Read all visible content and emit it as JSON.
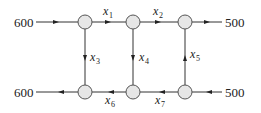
{
  "diagram": {
    "type": "network-flow",
    "inputs": {
      "top_left": "600",
      "top_right": "500",
      "bottom_left": "600",
      "bottom_right": "500"
    },
    "variables": [
      {
        "name": "x",
        "sub": "1",
        "from": "node-top-left",
        "to": "node-top-middle",
        "direction": "right"
      },
      {
        "name": "x",
        "sub": "2",
        "from": "node-top-middle",
        "to": "node-top-right",
        "direction": "right"
      },
      {
        "name": "x",
        "sub": "3",
        "from": "node-top-left",
        "to": "node-bottom-left",
        "direction": "down"
      },
      {
        "name": "x",
        "sub": "4",
        "from": "node-top-middle",
        "to": "node-bottom-middle",
        "direction": "down"
      },
      {
        "name": "x",
        "sub": "5",
        "from": "node-bottom-right",
        "to": "node-top-right",
        "direction": "up"
      },
      {
        "name": "x",
        "sub": "6",
        "from": "node-bottom-middle",
        "to": "node-bottom-left",
        "direction": "left"
      },
      {
        "name": "x",
        "sub": "7",
        "from": "node-bottom-right",
        "to": "node-bottom-middle",
        "direction": "left"
      }
    ],
    "external_flows": [
      {
        "value": "600",
        "at": "node-top-left",
        "direction": "in"
      },
      {
        "value": "500",
        "at": "node-top-right",
        "direction": "out"
      },
      {
        "value": "600",
        "at": "node-bottom-left",
        "direction": "out"
      },
      {
        "value": "500",
        "at": "node-bottom-right",
        "direction": "in"
      }
    ]
  }
}
